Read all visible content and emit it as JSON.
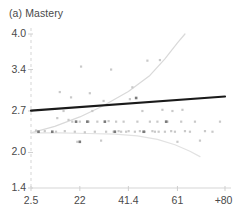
{
  "chart_data": {
    "type": "scatter",
    "title": "(a) Mastery",
    "xlabel": "",
    "ylabel": "",
    "xlim": [
      2.5,
      80
    ],
    "ylim": [
      1.4,
      4.0
    ],
    "grid": false,
    "legend": null,
    "xticks": [
      {
        "label": "2.5",
        "value": 2.5
      },
      {
        "label": "22",
        "value": 22
      },
      {
        "label": "41.4",
        "value": 41.4
      },
      {
        "label": "61",
        "value": 61
      },
      {
        "label": "+80.",
        "value": 80
      }
    ],
    "yticks": [
      {
        "label": "4.0",
        "value": 4.0
      },
      {
        "label": "3.4",
        "value": 3.4
      },
      {
        "label": "2.7",
        "value": 2.7
      },
      {
        "label": "2.0",
        "value": 2.0
      },
      {
        "label": "1.4",
        "value": 1.4
      }
    ],
    "series": [
      {
        "name": "fit-line",
        "type": "line",
        "color": "#1a1a1a",
        "points": [
          {
            "x": 2.5,
            "y": 2.705
          },
          {
            "x": 80,
            "y": 2.945
          }
        ]
      },
      {
        "name": "upper-confidence-band",
        "type": "line",
        "color": "#d9d9d9",
        "points": [
          {
            "x": 2.5,
            "y": 2.33
          },
          {
            "x": 12,
            "y": 2.44
          },
          {
            "x": 22,
            "y": 2.6
          },
          {
            "x": 31,
            "y": 2.78
          },
          {
            "x": 41.4,
            "y": 3.03
          },
          {
            "x": 50,
            "y": 3.3
          },
          {
            "x": 56,
            "y": 3.58
          },
          {
            "x": 61,
            "y": 3.85
          },
          {
            "x": 64,
            "y": 4.0
          }
        ]
      },
      {
        "name": "lower-confidence-band",
        "type": "line",
        "color": "#e2e2e2",
        "points": [
          {
            "x": 2.5,
            "y": 2.33
          },
          {
            "x": 14,
            "y": 2.33
          },
          {
            "x": 25,
            "y": 2.32
          },
          {
            "x": 36,
            "y": 2.31
          },
          {
            "x": 45,
            "y": 2.28
          },
          {
            "x": 53,
            "y": 2.22
          },
          {
            "x": 60,
            "y": 2.13
          },
          {
            "x": 66,
            "y": 2.02
          },
          {
            "x": 70,
            "y": 1.93
          }
        ]
      },
      {
        "name": "observations",
        "type": "scatter",
        "color": "#c9c9c9",
        "points": [
          {
            "x": 4.5,
            "y": 2.37
          },
          {
            "x": 8.0,
            "y": 2.36
          },
          {
            "x": 12.5,
            "y": 2.35
          },
          {
            "x": 14.0,
            "y": 3.02
          },
          {
            "x": 15.5,
            "y": 2.7
          },
          {
            "x": 17.5,
            "y": 2.55
          },
          {
            "x": 18.5,
            "y": 2.93
          },
          {
            "x": 19.0,
            "y": 2.52
          },
          {
            "x": 20.0,
            "y": 2.35
          },
          {
            "x": 21.0,
            "y": 2.18
          },
          {
            "x": 22.0,
            "y": 2.52
          },
          {
            "x": 22.5,
            "y": 3.45
          },
          {
            "x": 24.0,
            "y": 2.34
          },
          {
            "x": 25.5,
            "y": 2.52
          },
          {
            "x": 27.0,
            "y": 2.7
          },
          {
            "x": 28.0,
            "y": 2.35
          },
          {
            "x": 29.0,
            "y": 2.52
          },
          {
            "x": 30.5,
            "y": 2.2
          },
          {
            "x": 31.5,
            "y": 2.87
          },
          {
            "x": 32.5,
            "y": 2.35
          },
          {
            "x": 33.5,
            "y": 2.53
          },
          {
            "x": 34.5,
            "y": 3.4
          },
          {
            "x": 35.5,
            "y": 2.35
          },
          {
            "x": 36.5,
            "y": 2.52
          },
          {
            "x": 37.5,
            "y": 2.36
          },
          {
            "x": 38.5,
            "y": 2.35
          },
          {
            "x": 39.5,
            "y": 2.52
          },
          {
            "x": 40.5,
            "y": 2.35
          },
          {
            "x": 41.5,
            "y": 2.36
          },
          {
            "x": 42.0,
            "y": 2.9
          },
          {
            "x": 43.0,
            "y": 3.1
          },
          {
            "x": 44.0,
            "y": 2.35
          },
          {
            "x": 45.0,
            "y": 2.52
          },
          {
            "x": 46.0,
            "y": 2.36
          },
          {
            "x": 47.0,
            "y": 2.7
          },
          {
            "x": 48.0,
            "y": 2.35
          },
          {
            "x": 49.0,
            "y": 3.55
          },
          {
            "x": 50.0,
            "y": 2.52
          },
          {
            "x": 51.0,
            "y": 2.36
          },
          {
            "x": 52.0,
            "y": 2.35
          },
          {
            "x": 53.0,
            "y": 2.52
          },
          {
            "x": 54.0,
            "y": 3.56
          },
          {
            "x": 55.0,
            "y": 2.72
          },
          {
            "x": 56.0,
            "y": 2.35
          },
          {
            "x": 57.0,
            "y": 2.52
          },
          {
            "x": 58.5,
            "y": 2.36
          },
          {
            "x": 60.0,
            "y": 2.35
          },
          {
            "x": 61.0,
            "y": 2.18
          },
          {
            "x": 62.5,
            "y": 2.52
          },
          {
            "x": 64.0,
            "y": 2.36
          },
          {
            "x": 66.0,
            "y": 2.35
          },
          {
            "x": 68.0,
            "y": 2.52
          },
          {
            "x": 70.0,
            "y": 2.2
          },
          {
            "x": 72.0,
            "y": 2.36
          },
          {
            "x": 75.0,
            "y": 2.35
          },
          {
            "x": 78.0,
            "y": 2.52
          },
          {
            "x": 26.0,
            "y": 3.0
          },
          {
            "x": 13.0,
            "y": 2.58
          },
          {
            "x": 16.0,
            "y": 2.36
          },
          {
            "x": 59.0,
            "y": 2.7
          },
          {
            "x": 63.0,
            "y": 2.72
          },
          {
            "x": 53.5,
            "y": 2.35
          }
        ]
      },
      {
        "name": "observations-dark",
        "type": "scatter",
        "color": "#7a7a7a",
        "points": [
          {
            "x": 22.0,
            "y": 2.18
          },
          {
            "x": 44.5,
            "y": 2.92
          },
          {
            "x": 32.0,
            "y": 2.52
          },
          {
            "x": 36.0,
            "y": 2.35
          },
          {
            "x": 47.5,
            "y": 2.35
          },
          {
            "x": 56.5,
            "y": 2.52
          },
          {
            "x": 11.0,
            "y": 2.35
          },
          {
            "x": 5.5,
            "y": 2.35
          },
          {
            "x": 20.5,
            "y": 2.52
          },
          {
            "x": 25.0,
            "y": 2.52
          }
        ]
      }
    ]
  },
  "axes": {
    "axis_color": "#d5d5d5",
    "tick_color": "#cfcfcf",
    "label_color": "#4a4a4a"
  }
}
